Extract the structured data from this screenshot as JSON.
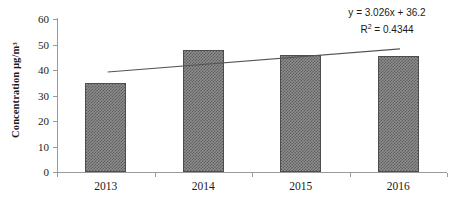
{
  "chart_data": {
    "type": "bar",
    "title": "",
    "subtitle": "",
    "xlabel": "",
    "ylabel": "Concentration µg/m³",
    "categories": [
      "2013",
      "2014",
      "2015",
      "2016"
    ],
    "values": [
      35,
      48,
      46,
      45.5
    ],
    "series": [
      {
        "name": "Concentration",
        "values": [
          35,
          48,
          46,
          45.5
        ]
      }
    ],
    "ylim": [
      0,
      60
    ],
    "ytick_labels": [
      "0",
      "10",
      "20",
      "30",
      "40",
      "50",
      "60"
    ],
    "ytick_values": [
      0,
      10,
      20,
      30,
      40,
      50,
      60
    ],
    "grid": false,
    "legend": false,
    "legend_position": "none",
    "bar_fill": "#8f8f8f",
    "bar_pattern": "fine-checkerboard",
    "bar_border_color": "#4d4d4d",
    "axis_color": "#9a9a9a",
    "trendline": {
      "type": "linear",
      "equation": "y = 3.026x + 36.2",
      "r_squared_label": "R² = 0.4344",
      "slope": 3.026,
      "intercept": 36.2,
      "r_squared": 0.4344,
      "color": "#555555",
      "start_value": 39.2,
      "end_value": 48.3
    },
    "annotations": [
      {
        "name": "trendline-equation",
        "text": "y = 3.026x + 36.2"
      },
      {
        "name": "trendline-r-squared",
        "text": "R² = 0.4344"
      }
    ]
  },
  "axis": {
    "y_title_main": "Concentration µg/m",
    "y_title_sup": "3"
  },
  "equation": {
    "line1": "y = 3.026x + 36.2",
    "line2_prefix": "R",
    "line2_sup": "2",
    "line2_suffix": " = 0.4344"
  }
}
